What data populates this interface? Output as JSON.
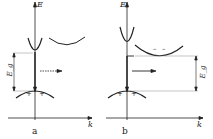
{
  "diagrams": [
    {
      "id": "a",
      "caption": "a",
      "axis_y_label": "E",
      "axis_x_label": "k",
      "gap_label": "E_g",
      "holes": [
        "+",
        "+"
      ],
      "transition": "direct"
    },
    {
      "id": "b",
      "caption": "b",
      "axis_y_label": "E",
      "axis_x_label": "k",
      "gap_label": "E_g",
      "holes": [
        "+",
        "+"
      ],
      "electrons": [
        "–",
        "–"
      ],
      "transition": "indirect"
    }
  ]
}
